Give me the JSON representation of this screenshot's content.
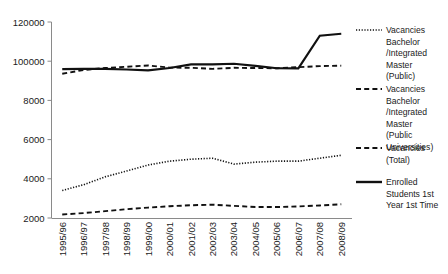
{
  "chart_data": {
    "type": "line",
    "title": "",
    "subtitle": "",
    "xlabel": "",
    "ylabel": "",
    "grid": false,
    "legend_position": "right",
    "categories": [
      "1995/96",
      "1996/97",
      "1997/98",
      "1998/99",
      "1999/00",
      "2000/01",
      "2001/02",
      "2002/03",
      "2003/04",
      "2004/05",
      "2005/06",
      "2006/07",
      "2007/08",
      "2008/09"
    ],
    "ytick_labels": [
      "120000",
      "100000",
      "8000",
      "6000",
      "4000",
      "2000"
    ],
    "ytick_values": [
      120000,
      100000,
      8000,
      6000,
      4000,
      2000
    ],
    "ylim": [
      2000,
      120000
    ],
    "series": [
      {
        "name": "Vacancies Bachelor /Integrated Master (Public)",
        "style": "dotted",
        "values": [
          3400,
          3700,
          4100,
          4400,
          4700,
          4900,
          5000,
          5050,
          4750,
          4850,
          4900,
          4900,
          5050,
          5200
        ]
      },
      {
        "name": "Vacancies Bachelor /Integrated Master (Public Universities)",
        "style": "dashed",
        "values": [
          2180,
          2250,
          2350,
          2450,
          2530,
          2600,
          2650,
          2680,
          2620,
          2560,
          2560,
          2590,
          2640,
          2700
        ]
      },
      {
        "name": "Vacancies (Total)",
        "style": "longdash",
        "values": [
          70500,
          79500,
          84000,
          87000,
          90000,
          85000,
          84500,
          82000,
          84500,
          84000,
          83500,
          86000,
          88500,
          89500
        ]
      },
      {
        "name": "Enrolled Students 1st Year 1st Time",
        "style": "solid",
        "values": [
          81500,
          81800,
          82000,
          80500,
          78500,
          84000,
          92500,
          92500,
          94000,
          89000,
          83500,
          83000,
          113000,
          114000
        ]
      }
    ]
  },
  "legend": {
    "entries": [
      {
        "line1": "Vacancies",
        "line2": "Bachelor",
        "line3": "/Integrated",
        "line4": "Master",
        "line5": "(Public)",
        "line6": ""
      },
      {
        "line1": "Vacancies",
        "line2": "Bachelor",
        "line3": "/Integrated",
        "line4": "Master",
        "line5": "(Public",
        "line6": "Universities)"
      },
      {
        "line1": "Vacancies",
        "line2": "(Total)",
        "line3": "",
        "line4": "",
        "line5": "",
        "line6": ""
      },
      {
        "line1": "Enrolled",
        "line2": "Students 1st",
        "line3": "Year 1st Time",
        "line4": "",
        "line5": "",
        "line6": ""
      }
    ]
  },
  "colors": {
    "series_stroke": "#111111",
    "axis": "#8a8a8a",
    "text": "#1a1a1a",
    "background": "#ffffff"
  }
}
